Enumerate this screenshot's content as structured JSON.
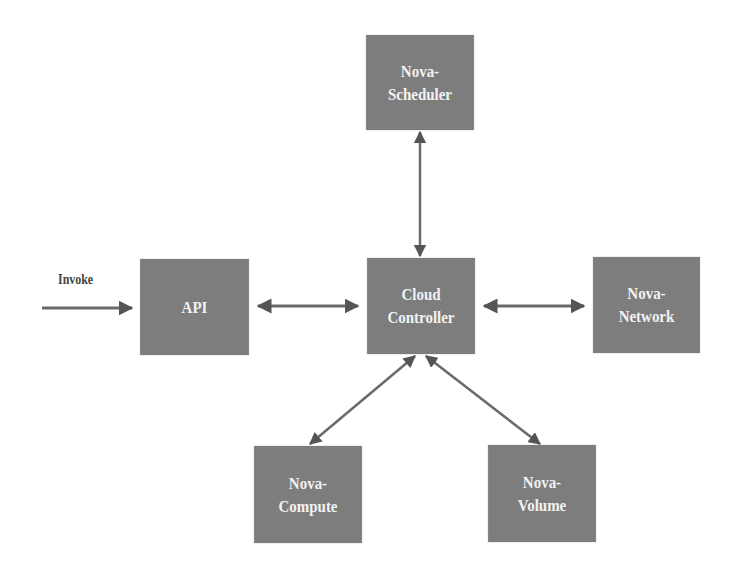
{
  "diagram": {
    "type": "architecture",
    "colors": {
      "box_fill": "#7d7d7d",
      "box_text": "#f2f2f2",
      "arrow": "#555555",
      "background": "#ffffff"
    },
    "nodes": [
      {
        "id": "scheduler",
        "label": "Nova-\nScheduler",
        "x": 359,
        "y": 35,
        "w": 122,
        "h": 95
      },
      {
        "id": "api",
        "label": "API",
        "x": 133,
        "y": 259,
        "w": 123,
        "h": 96
      },
      {
        "id": "controller",
        "label": "Cloud\nController",
        "x": 360,
        "y": 258,
        "w": 122,
        "h": 96
      },
      {
        "id": "network",
        "label": "Nova-\nNetwork",
        "x": 586,
        "y": 257,
        "w": 121,
        "h": 96
      },
      {
        "id": "compute",
        "label": "Nova-\nCompute",
        "x": 247,
        "y": 446,
        "w": 122,
        "h": 97
      },
      {
        "id": "volume",
        "label": "Nova-\nVolume",
        "x": 481,
        "y": 445,
        "w": 122,
        "h": 97
      }
    ],
    "edges": [
      {
        "from": "external",
        "to": "api",
        "label": "Invoke",
        "direction": "one-way"
      },
      {
        "from": "api",
        "to": "controller",
        "direction": "bidirectional"
      },
      {
        "from": "controller",
        "to": "scheduler",
        "direction": "bidirectional"
      },
      {
        "from": "controller",
        "to": "network",
        "direction": "bidirectional"
      },
      {
        "from": "controller",
        "to": "compute",
        "direction": "bidirectional"
      },
      {
        "from": "controller",
        "to": "volume",
        "direction": "bidirectional"
      }
    ],
    "invoke_label": "Invoke"
  }
}
